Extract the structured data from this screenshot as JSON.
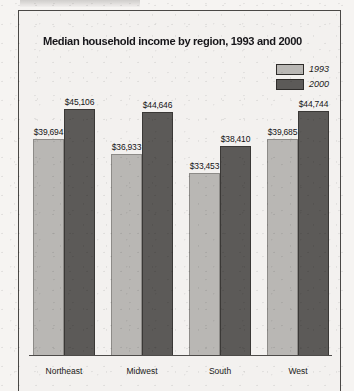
{
  "figure": {
    "cutoff_header_text": ""
  },
  "chart_data": {
    "type": "bar",
    "title": "Median household income by region, 1993 and 2000",
    "xlabel": "",
    "ylabel": "",
    "categories": [
      "Northeast",
      "Midwest",
      "South",
      "West"
    ],
    "series": [
      {
        "name": "1993",
        "color": "#b9b7b4",
        "values": [
          39694,
          36933,
          33453,
          39685
        ],
        "labels": [
          "$39,694",
          "$36,933",
          "$33,453",
          "$39,685"
        ]
      },
      {
        "name": "2000",
        "color": "#5c5a58",
        "values": [
          45106,
          44646,
          38410,
          44744
        ],
        "labels": [
          "$45,106",
          "$44,646",
          "$38,410",
          "$44,744"
        ]
      }
    ],
    "ylim": [
      0,
      45106
    ],
    "grid": false,
    "legend_position": "top-right",
    "axis_visible": "x-baseline-only",
    "value_labels_shown": true
  },
  "legend": {
    "entries": [
      {
        "label": "1993",
        "swatch_name": "legend-swatch-1993"
      },
      {
        "label": "2000",
        "swatch_name": "legend-swatch-2000"
      }
    ]
  }
}
